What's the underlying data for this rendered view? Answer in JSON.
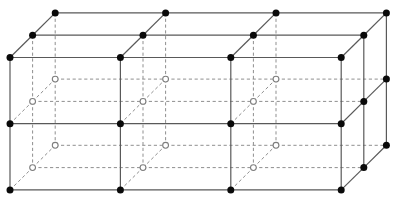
{
  "diagram": {
    "title": "",
    "type": "cubic-lattice-oblique-projection",
    "lattice": {
      "cubes_wide": 3,
      "cubes_tall": 2,
      "cubes_deep": 2,
      "vertex_cols": 4,
      "vertex_rows": 3,
      "vertex_layers": 3,
      "visible_vertex_rule": "front-face or top-face or right-face",
      "hidden_vertex_rule": "interior, left, back and bottom lattice points"
    },
    "projection": {
      "origin_x": 10,
      "origin_y": 57.5,
      "col_step": 110.4,
      "row_step": 66.2,
      "depth_dx": 22.6,
      "depth_dy": -22.3
    },
    "style": {
      "background": "#ffffff",
      "solid_edge_color": "#595959",
      "solid_edge_width": 1.2,
      "dashed_edge_color": "#8f8f8f",
      "dashed_edge_width": 1,
      "dash_pattern": "3.2 2.6",
      "filled_vertex_color": "#0a0a0a",
      "filled_vertex_radius": 3.5,
      "open_vertex_fill": "#ffffff",
      "open_vertex_stroke": "#7d7d7d",
      "open_vertex_stroke_width": 1.1,
      "open_vertex_radius": 2.9
    },
    "canvas": {
      "width": 404,
      "height": 209
    }
  }
}
